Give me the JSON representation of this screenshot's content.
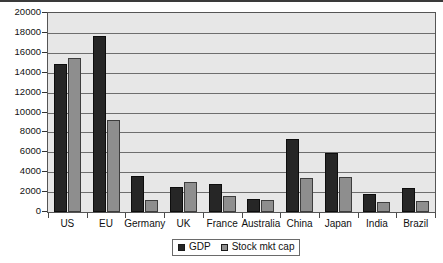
{
  "chart_data": {
    "type": "bar",
    "title": "",
    "subtitle": "",
    "xlabel": "",
    "ylabel": "",
    "ylim": [
      0,
      20000
    ],
    "ytick_step": 2000,
    "yticks": [
      "0",
      "2000",
      "4000",
      "6000",
      "8000",
      "10000",
      "12000",
      "14000",
      "16000",
      "18000",
      "20000"
    ],
    "grid": true,
    "grid_axis": "y",
    "legend_position": "bottom",
    "categories": [
      "US",
      "EU",
      "Germany",
      "UK",
      "France",
      "Australia",
      "China",
      "Japan",
      "India",
      "Brazil"
    ],
    "series": [
      {
        "name": "GDP",
        "color": "#262626",
        "values": [
          14900,
          17700,
          3650,
          2550,
          2800,
          1300,
          7300,
          5900,
          1800,
          2450
        ]
      },
      {
        "name": "Stock mkt cap",
        "color": "#8e8e8e",
        "values": [
          15500,
          9200,
          1200,
          3000,
          1600,
          1250,
          3400,
          3500,
          1000,
          1100
        ]
      }
    ]
  },
  "legend": {
    "items": [
      {
        "label": "GDP",
        "swatch": "gdp"
      },
      {
        "label": "Stock mkt cap",
        "swatch": "cap"
      }
    ]
  },
  "colors": {
    "plot_background": "#e7e7e7",
    "gridline": "#6e6e6e",
    "frame": "#555555",
    "series_gdp": "#262626",
    "series_cap": "#8e8e8e",
    "text": "#111111"
  }
}
